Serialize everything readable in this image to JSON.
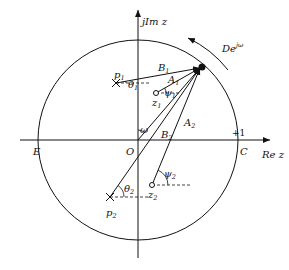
{
  "diagram": {
    "axes": {
      "imag_label": "jIm z",
      "real_label": "Re z",
      "unit_label": "+1"
    },
    "points": {
      "O": "O",
      "C": "C",
      "E": "E",
      "p1": "p",
      "p1_sub": "1",
      "p2": "p",
      "p2_sub": "2",
      "z1": "z",
      "z1_sub": "1",
      "z2": "z",
      "z2_sub": "2"
    },
    "vectors": {
      "A1": "A",
      "A1_sub": "1",
      "A2": "A",
      "A2_sub": "2",
      "B1": "B",
      "B1_sub": "1",
      "B2": "B",
      "B2_sub": "2"
    },
    "angles": {
      "theta1": "θ",
      "theta1_sub": "1",
      "theta2": "θ",
      "theta2_sub": "2",
      "psi1": "ψ",
      "psi1_sub": "1",
      "psi2": "ψ",
      "psi2_sub": "2",
      "omega": "ω"
    },
    "arc_label": "De",
    "arc_label_sup": "jω"
  }
}
